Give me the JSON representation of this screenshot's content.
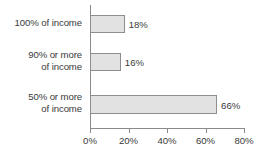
{
  "chart_data": {
    "type": "bar",
    "orientation": "horizontal",
    "title": "",
    "subtitle": "",
    "xlabel": "",
    "ylabel": "",
    "categories": [
      "100% of income",
      "90% or more\nof income",
      "50% or more\nof income"
    ],
    "values": [
      18,
      16,
      66
    ],
    "value_labels": [
      "18%",
      "16%",
      "66%"
    ],
    "xlim": [
      0,
      80
    ],
    "xticks": [
      0,
      20,
      40,
      60,
      80
    ],
    "xtick_labels": [
      "0%",
      "20%",
      "40%",
      "60%",
      "80%"
    ],
    "grid": false,
    "legend": null,
    "series": [
      {
        "name": "",
        "values": [
          18,
          16,
          66
        ]
      }
    ],
    "colors": {
      "bar_fill": "#e2e2e2",
      "bar_border": "#8e8e8e",
      "axis": "#8a8a8a",
      "text": "#3a3a3a",
      "background": "#ffffff"
    }
  }
}
